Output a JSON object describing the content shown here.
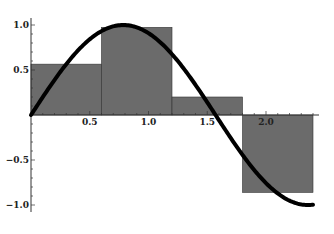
{
  "chart_data": {
    "type": "bar",
    "subtype": "riemann-sum-midpoint-with-curve",
    "title": "",
    "xlabel": "",
    "ylabel": "",
    "xlim": [
      0,
      2.4
    ],
    "ylim": [
      -1.0,
      1.0
    ],
    "x_ticks": [
      0.5,
      1.0,
      1.5,
      2.0
    ],
    "x_tick_labels": [
      "0.5",
      "1.0",
      "1.5",
      "2.0"
    ],
    "y_ticks": [
      -1.0,
      -0.5,
      0.5,
      1.0
    ],
    "y_tick_labels": [
      "-1.0",
      "-0.5",
      "0.5",
      "1.0"
    ],
    "grid": false,
    "legend": null,
    "bars": [
      {
        "x0": 0.0,
        "x1": 0.6,
        "height": 0.565
      },
      {
        "x0": 0.6,
        "x1": 1.2,
        "height": 0.974
      },
      {
        "x0": 1.2,
        "x1": 1.8,
        "height": 0.2
      },
      {
        "x0": 1.8,
        "x1": 2.4,
        "height": -0.86
      }
    ],
    "curve": {
      "function": "sin(2x)",
      "x_range": [
        0,
        2.4
      ]
    },
    "colors": {
      "bar_fill": "#6b6b6b",
      "bar_stroke": "#333333",
      "curve": "#000000",
      "axis": "#333333"
    }
  }
}
